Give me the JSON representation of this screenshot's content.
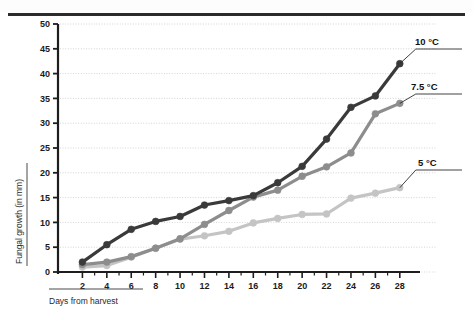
{
  "figure": {
    "y_axis_title": "Fungal growth (in mm)",
    "x_axis_title": "Days from harvest"
  },
  "labels": {
    "series_10": "10 °C",
    "series_75": "7.5 °C",
    "series_5": "5 °C"
  },
  "chart_data": {
    "type": "line",
    "title": "",
    "xlabel": "Days from harvest",
    "ylabel": "Fungal growth (in mm)",
    "xlim": [
      0,
      29
    ],
    "ylim": [
      0,
      50
    ],
    "xticks": [
      2,
      4,
      6,
      8,
      10,
      12,
      14,
      16,
      18,
      20,
      22,
      24,
      26,
      28
    ],
    "yticks": [
      0,
      5,
      10,
      15,
      20,
      25,
      30,
      35,
      40,
      45,
      50
    ],
    "grid": "horizontal-dotted",
    "legend": "right-of-plot-leader-lines",
    "x": [
      2,
      4,
      6,
      8,
      10,
      12,
      14,
      16,
      18,
      20,
      22,
      24,
      26,
      28
    ],
    "series": [
      {
        "name": "10 °C",
        "color": "#3a3a3a",
        "values": [
          2.0,
          5.5,
          8.6,
          10.2,
          11.2,
          13.5,
          14.4,
          15.4,
          18.0,
          21.3,
          26.8,
          33.2,
          35.5,
          42.0
        ]
      },
      {
        "name": "7.5 °C",
        "color": "#8d8d8d",
        "values": [
          1.5,
          2.0,
          3.1,
          4.8,
          6.7,
          9.6,
          12.4,
          15.1,
          16.5,
          19.3,
          21.2,
          24.0,
          31.9,
          34.0
        ]
      },
      {
        "name": "5 °C",
        "color": "#c4c4c4",
        "values": [
          1.0,
          1.3,
          3.0,
          4.8,
          6.6,
          7.3,
          8.2,
          9.9,
          10.8,
          11.6,
          11.7,
          14.9,
          15.9,
          17.0
        ]
      }
    ]
  }
}
